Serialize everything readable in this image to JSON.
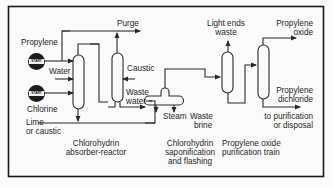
{
  "diagram": {
    "border_color": "#1a1a1a",
    "line_color": "#2a2a2a",
    "inputs": {
      "propylene": "Propylene",
      "water": "Water",
      "chlorine": "Chlorine",
      "lime_line1": "Lime",
      "lime_line2": "or caustic",
      "caustic": "Caustic"
    },
    "pump_badge_text": "START",
    "outputs": {
      "purge": "Purge",
      "waste_water_line1": "Waste",
      "waste_water_line2": "water",
      "steam": "Steam",
      "waste_brine_line1": "Waste",
      "waste_brine_line2": "brine",
      "light_ends_line1": "Light ends",
      "light_ends_line2": "waste",
      "propylene_oxide_line1": "Propylene",
      "propylene_oxide_line2": "oxide",
      "propylene_dichloride_line1": "Propylene",
      "propylene_dichloride_line2": "dichloride",
      "disposal_line1": "to purification",
      "disposal_line2": "or disposal"
    },
    "sections": {
      "absorber_line1": "Chlorohydrin",
      "absorber_line2": "absorber-reactor",
      "saponification_line1": "Chlorohydrin",
      "saponification_line2": "saponification",
      "saponification_line3": "and flashing",
      "purification_line1": "Propylene oxide",
      "purification_line2": "purification train"
    }
  }
}
